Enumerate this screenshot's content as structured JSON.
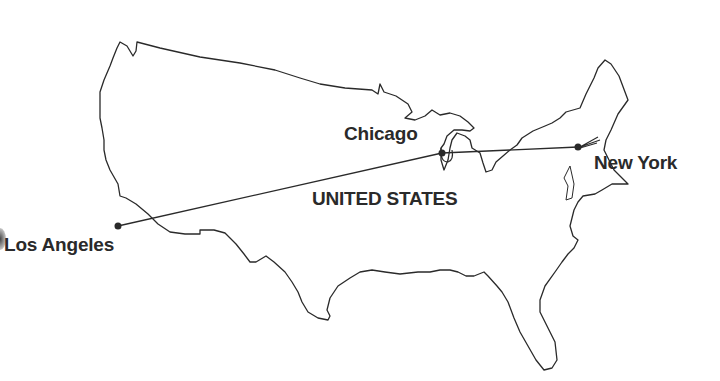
{
  "map": {
    "country_label": "UNITED STATES",
    "stroke_color": "#2a2a2a",
    "background": "#ffffff",
    "cities": [
      {
        "name": "Los Angeles",
        "x": 118,
        "y": 226
      },
      {
        "name": "Chicago",
        "x": 442,
        "y": 153
      },
      {
        "name": "New York",
        "x": 578,
        "y": 147
      }
    ],
    "routes": [
      {
        "from": "Los Angeles",
        "to": "Chicago"
      },
      {
        "from": "Chicago",
        "to": "New York"
      }
    ]
  }
}
